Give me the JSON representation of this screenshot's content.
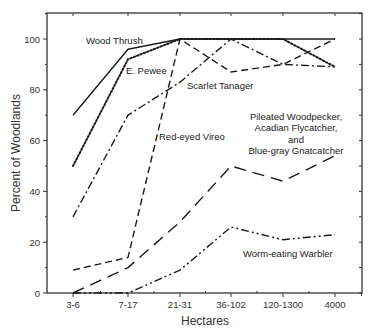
{
  "chart_data": {
    "type": "line",
    "title": "",
    "xlabel": "Hectares",
    "ylabel": "Percent of Woodlands",
    "categories": [
      "3-6",
      "7-17",
      "21-31",
      "36-102",
      "120-1300",
      "4000"
    ],
    "ylim": [
      0,
      110
    ],
    "yticks": [
      0,
      20,
      40,
      60,
      80,
      100
    ],
    "grid": false,
    "legend": "inline labels",
    "series": [
      {
        "name": "Wood Thrush",
        "style": "solid",
        "values": [
          70,
          96,
          100,
          100,
          100,
          100
        ],
        "label": {
          "lines": [
            "Wood Thrush"
          ],
          "x": 86,
          "y": 44,
          "anchor": "start"
        }
      },
      {
        "name": "E. Pewee",
        "style": "dotted",
        "values": [
          50,
          92,
          100,
          100,
          100,
          89
        ],
        "label": {
          "lines": [
            "E. Pewee"
          ],
          "x": 126,
          "y": 74,
          "anchor": "start"
        }
      },
      {
        "name": "Scarlet Tanager",
        "style": "dashdot",
        "values": [
          30,
          70,
          83,
          100,
          90,
          89
        ],
        "label": {
          "lines": [
            "Scarlet Tanager"
          ],
          "x": 187,
          "y": 89,
          "anchor": "start"
        }
      },
      {
        "name": "Red-eyed Vireo",
        "style": "dashed",
        "values": [
          9,
          14,
          100,
          87,
          90,
          100
        ],
        "label": {
          "lines": [
            "Red-eyed Vireo"
          ],
          "x": 159,
          "y": 140,
          "anchor": "start"
        }
      },
      {
        "name": "Pileated Woodpecker, Acadian Flycatcher, and Blue-gray Gnatcatcher",
        "style": "longdash",
        "values": [
          0,
          10,
          28,
          50,
          44,
          54
        ],
        "label": {
          "lines": [
            "Pileated Woodpecker,",
            "Acadian Flycatcher,",
            "and",
            "Blue-gray Gnatcatcher"
          ],
          "x": 296,
          "y": 120,
          "anchor": "middle"
        }
      },
      {
        "name": "Worm-eating Warbler",
        "style": "dashdotdot",
        "values": [
          0,
          0,
          9,
          26,
          21,
          23
        ],
        "label": {
          "lines": [
            "Worm-eating Warbler"
          ],
          "x": 243,
          "y": 257,
          "anchor": "start"
        }
      }
    ]
  }
}
